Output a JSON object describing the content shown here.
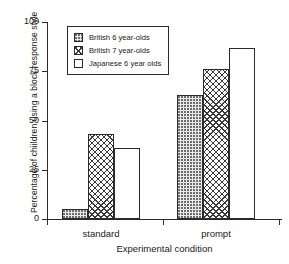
{
  "chart_data": {
    "type": "bar",
    "title": "",
    "xlabel": "Experimental condition",
    "ylabel": "Percentage of chiildren using a block response style",
    "categories": [
      "standard",
      "prompt"
    ],
    "series": [
      {
        "name": "British 6 year-olds",
        "pattern": "dots",
        "values": [
          5,
          63
        ]
      },
      {
        "name": "British 7 year-olds",
        "pattern": "cross",
        "values": [
          43,
          76
        ]
      },
      {
        "name": "Japanese 6 year olds",
        "pattern": "empty",
        "values": [
          36,
          87
        ]
      }
    ],
    "ylim": [
      0,
      100
    ],
    "yticks": [
      "0",
      "25",
      "50",
      "75",
      "100"
    ],
    "ytick_values": [
      0,
      25,
      50,
      75,
      100
    ],
    "grid": false,
    "legend_position": "top-left-inside"
  },
  "legend": {
    "items": [
      {
        "label": "British 6 year-olds"
      },
      {
        "label": "British 7 year-olds"
      },
      {
        "label": "Japanese 6 year olds"
      }
    ]
  },
  "axes": {
    "y_title": "Percentage of chiildren using a block response style",
    "x_title": "Experimental condition",
    "y_ticks": [
      {
        "label": "100",
        "value": 100
      },
      {
        "label": "75",
        "value": 75
      },
      {
        "label": "50",
        "value": 50
      },
      {
        "label": "25",
        "value": 25
      },
      {
        "label": "0",
        "value": 0
      }
    ],
    "x_categories": [
      {
        "label": "standard"
      },
      {
        "label": "prompt"
      }
    ]
  },
  "colors": {
    "axis": "#2b2b2b",
    "bar_outline": "#2b2b2b",
    "dots_fill": "#e9e9e9",
    "empty_fill": "#ffffff",
    "background": "#ffffff"
  }
}
